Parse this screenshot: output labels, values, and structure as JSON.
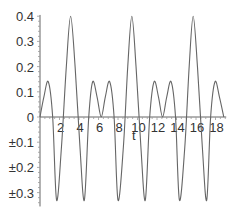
{
  "chart_data": {
    "type": "line",
    "title": "",
    "xlabel": "t",
    "ylabel": "",
    "xlim": [
      0,
      19
    ],
    "ylim": [
      -0.35,
      0.42
    ],
    "grid": false,
    "legend": null,
    "x_ticks": [
      2,
      4,
      6,
      8,
      10,
      12,
      14,
      16,
      18
    ],
    "x_tick_labels": [
      "2",
      "4",
      "6",
      "8",
      "10",
      "12",
      "14",
      "16",
      "18"
    ],
    "y_ticks": [
      0.4,
      0.3,
      0.2,
      0.1,
      0,
      -0.1,
      -0.2,
      -0.3
    ],
    "y_tick_labels": [
      "0.4",
      "0.3",
      "0.2",
      "0.1",
      "0",
      "±0.1",
      "±0.2",
      "±0.3"
    ],
    "line_color": "#666666",
    "series": [
      {
        "name": "f(t)",
        "x": [
          0,
          0.4,
          0.85,
          1.3,
          1.7,
          2.2,
          2.7,
          3.14,
          3.6,
          4.1,
          4.55,
          5.0,
          5.4,
          5.85,
          6.28,
          6.7,
          7.15,
          7.6,
          8.0,
          8.55,
          9.0,
          9.42,
          9.85,
          10.35,
          10.8,
          11.25,
          11.7,
          12.15,
          12.57,
          13.0,
          13.45,
          13.9,
          14.3,
          14.85,
          15.3,
          15.71,
          16.15,
          16.65,
          17.1,
          17.5,
          17.95,
          18.4,
          18.85
        ],
        "y": [
          0,
          0.08,
          0.14,
          0.0,
          -0.33,
          -0.12,
          0.2,
          0.4,
          0.2,
          -0.12,
          -0.33,
          0.0,
          0.14,
          0.08,
          0.0,
          0.08,
          0.14,
          0.0,
          -0.33,
          -0.12,
          0.2,
          0.4,
          0.2,
          -0.12,
          -0.33,
          0.0,
          0.14,
          0.08,
          0.0,
          0.08,
          0.14,
          0.0,
          -0.33,
          -0.12,
          0.2,
          0.4,
          0.2,
          -0.12,
          -0.33,
          0.0,
          0.14,
          0.08,
          0.0
        ]
      }
    ]
  }
}
